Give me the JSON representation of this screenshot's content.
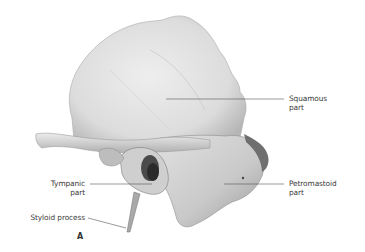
{
  "figure": {
    "panel_letter": "A",
    "labels": {
      "squamous": [
        "Squamous",
        "part"
      ],
      "petromastoid": [
        "Petromastoid",
        "part"
      ],
      "tympanic": [
        "Tympanic",
        "part"
      ],
      "styloid": [
        "Styloid process"
      ]
    },
    "colors": {
      "background": "#ffffff",
      "bone_light": "#e6e6e6",
      "bone_mid": "#c8c8c8",
      "bone_shadow": "#8a8a8a",
      "leader_line": "#555555",
      "text": "#3a3a3a"
    }
  }
}
